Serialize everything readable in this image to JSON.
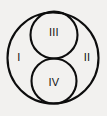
{
  "figure": {
    "kind": "euler-venn-diagram",
    "background_color": "#f2f1ef",
    "stroke_color": "#0d0d0d",
    "label_color": "#111111",
    "width": 107,
    "height": 116,
    "circles": [
      {
        "id": "outer",
        "name": "outer-boundary-circle",
        "cx": 53,
        "cy": 58,
        "r": 45.5,
        "stroke_width": 2.1
      },
      {
        "id": "upper",
        "name": "upper-inner-circle",
        "cx": 54,
        "cy": 35,
        "r": 23.5,
        "stroke_width": 2.1
      },
      {
        "id": "lower",
        "name": "lower-inner-circle",
        "cx": 54,
        "cy": 81,
        "r": 22.5,
        "stroke_width": 2.1
      }
    ],
    "labels": {
      "region_1": "I",
      "region_2": "II",
      "region_3": "III",
      "region_4": "IV"
    }
  }
}
